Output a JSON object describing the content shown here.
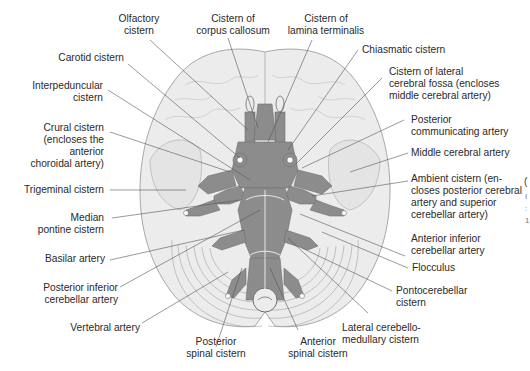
{
  "figure": {
    "colors": {
      "background": "#ffffff",
      "brain_fill": "#ececec",
      "brain_stroke": "#a8a8a8",
      "cistern_fill": "#8c8c8c",
      "cistern_stroke": "#6f6f6f",
      "leader_line": "#555555",
      "text": "#2a2a2a"
    },
    "labels": {
      "olfactory": [
        "Olfactory",
        "cistern"
      ],
      "corpus_callosum": [
        "Cistern of",
        "corpus callosum"
      ],
      "lamina_terminalis": [
        "Cistern of",
        "lamina terminalis"
      ],
      "carotid": [
        "Carotid cistern"
      ],
      "chiasmatic": [
        "Chiasmatic cistern"
      ],
      "interpeduncular": [
        "Interpeduncular",
        "cistern"
      ],
      "lateral_cerebral_fossa": [
        "Cistern of lateral",
        "cerebral fossa (encloses",
        "middle cerebral artery)"
      ],
      "crural": [
        "Crural cistern",
        "(encloses the",
        "anterior",
        "choroidal artery)"
      ],
      "post_communicating": [
        "Posterior",
        "communicating artery"
      ],
      "middle_cerebral": [
        "Middle cerebral artery"
      ],
      "trigeminal": [
        "Trigeminal cistern"
      ],
      "ambient": [
        "Ambient cistern (en-",
        "closes posterior cerebral",
        "artery and superior",
        "cerebellar artery)"
      ],
      "median_pontine": [
        "Median",
        "pontine cistern"
      ],
      "basilar": [
        "Basilar artery"
      ],
      "ant_inf_cerebellar": [
        "Anterior inferior",
        "cerebellar artery"
      ],
      "flocculus": [
        "Flocculus"
      ],
      "post_inf_cerebellar": [
        "Posterior inferior",
        "cerebellar artery"
      ],
      "pontocerebellar": [
        "Pontocerebellar",
        "cistern"
      ],
      "vertebral": [
        "Vertebral artery"
      ],
      "lateral_cerebellomedullary": [
        "Lateral cerebello-",
        "medullary cistern"
      ],
      "posterior_spinal": [
        "Posterior",
        "spinal cistern"
      ],
      "anterior_spinal": [
        "Anterior",
        "spinal cistern"
      ]
    },
    "edge_fragments": [
      "(",
      "I",
      ":",
      "1"
    ]
  }
}
